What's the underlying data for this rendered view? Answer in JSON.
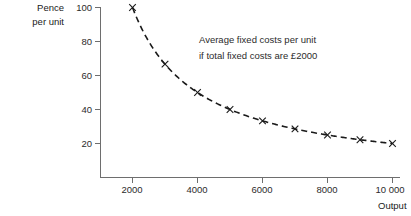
{
  "chart_data": {
    "type": "line",
    "title": "",
    "subtitle": "",
    "xlabel": "Output",
    "ylabel_lines": [
      "Pence",
      "per unit"
    ],
    "x": [
      2000,
      3000,
      4000,
      5000,
      6000,
      7000,
      8000,
      9000,
      10000
    ],
    "values": [
      100,
      66.7,
      50,
      40,
      33.3,
      28.6,
      25,
      22.2,
      20
    ],
    "series": [
      {
        "name": "Average fixed costs per unit",
        "values": [
          100,
          66.7,
          50,
          40,
          33.3,
          28.6,
          25,
          22.2,
          20
        ]
      }
    ],
    "xlim": [
      0,
      10000
    ],
    "ylim": [
      0,
      100
    ],
    "xticks": [
      2000,
      4000,
      6000,
      8000,
      10000
    ],
    "xtick_labels": [
      "2000",
      "4000",
      "6000",
      "8000",
      "10 000"
    ],
    "yticks": [
      20,
      40,
      60,
      80,
      100
    ],
    "ytick_labels": [
      "20",
      "40",
      "60",
      "80",
      "100"
    ],
    "grid": false,
    "legend_position": "none",
    "line_style": "dashed",
    "marker": "x",
    "line_color": "#1a1a1a",
    "annotations": [
      {
        "lines": [
          "Average fixed costs per unit",
          "if total fixed costs are £2000"
        ],
        "x": 4050,
        "y": 76
      }
    ]
  },
  "axes": {
    "y_label_line1": "Pence",
    "y_label_line2": "per unit",
    "x_label": "Output"
  },
  "ticks": {
    "y": [
      {
        "label": "100"
      },
      {
        "label": "80"
      },
      {
        "label": "60"
      },
      {
        "label": "40"
      },
      {
        "label": "20"
      }
    ],
    "x": [
      {
        "label": "2000"
      },
      {
        "label": "4000"
      },
      {
        "label": "6000"
      },
      {
        "label": "8000"
      },
      {
        "label": "10 000"
      }
    ]
  },
  "annotation": {
    "line1": "Average fixed costs per unit",
    "line2": "if total fixed costs are £2000"
  },
  "colors": {
    "curve": "#1a1a1a",
    "axis": "#6e6e6e",
    "text": "#2b2b2b",
    "background": "#ffffff"
  }
}
